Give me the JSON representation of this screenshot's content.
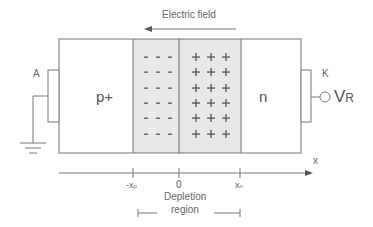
{
  "title": "Electric field",
  "regions": {
    "p_label": "p+",
    "n_label": "n",
    "depletion_label_line1": "Depletion",
    "depletion_label_line2": "region"
  },
  "terminals": {
    "anode": "A",
    "cathode": "K",
    "voltage": "V",
    "voltage_sub": "R"
  },
  "axis": {
    "label": "x",
    "ticks": [
      {
        "label": "-x",
        "sub": "p"
      },
      {
        "label": "0",
        "sub": ""
      },
      {
        "label": "x",
        "sub": "n"
      }
    ]
  },
  "charges": {
    "negative": "-",
    "positive": "+",
    "rows": 6,
    "cols": 3
  },
  "colors": {
    "line": "#777777",
    "depletion_fill": "#e6e6e6",
    "text": "#555555"
  }
}
